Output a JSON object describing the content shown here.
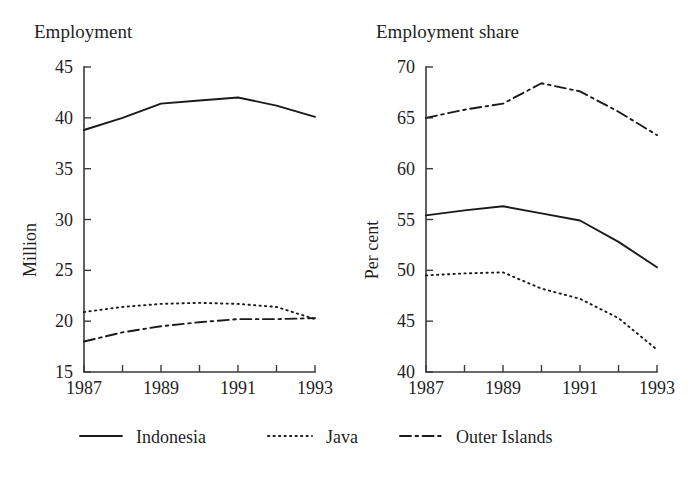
{
  "figure": {
    "background": "#ffffff",
    "ink_color": "#1a1a1a"
  },
  "legend": {
    "position": "bottom",
    "items": [
      {
        "label": "Indonesia",
        "style": "solid",
        "dash": "none"
      },
      {
        "label": "Java",
        "style": "dotted",
        "dash": "1,4"
      },
      {
        "label": "Outer Islands",
        "style": "dash-dot",
        "dash": "11,4,2.5,4"
      }
    ]
  },
  "chart_data": [
    {
      "type": "line",
      "title": "Employment",
      "xlabel": "",
      "ylabel": "Million",
      "x": [
        1987,
        1988,
        1989,
        1990,
        1991,
        1992,
        1993
      ],
      "xticks": [
        1987,
        1988,
        1989,
        1990,
        1991,
        1992,
        1993
      ],
      "xticklabels": [
        "1987",
        "",
        "1989",
        "",
        "1991",
        "",
        "1993"
      ],
      "yticks": [
        15,
        20,
        25,
        30,
        35,
        40,
        45
      ],
      "yticklabels": [
        "15",
        "20",
        "25",
        "30",
        "35",
        "40",
        "45"
      ],
      "xlim": [
        1987,
        1993
      ],
      "ylim": [
        15,
        45
      ],
      "grid": false,
      "series": [
        {
          "name": "Indonesia",
          "style": "solid",
          "values": [
            38.8,
            40.0,
            41.4,
            41.7,
            42.0,
            41.2,
            40.1
          ]
        },
        {
          "name": "Java",
          "style": "dotted",
          "values": [
            20.9,
            21.4,
            21.7,
            21.8,
            21.7,
            21.4,
            20.2
          ]
        },
        {
          "name": "Outer Islands",
          "style": "dash-dot",
          "values": [
            18.0,
            18.9,
            19.5,
            19.9,
            20.2,
            20.2,
            20.3
          ]
        }
      ]
    },
    {
      "type": "line",
      "title": "Employment share",
      "xlabel": "",
      "ylabel": "Per cent",
      "x": [
        1987,
        1988,
        1989,
        1990,
        1991,
        1992,
        1993
      ],
      "xticks": [
        1987,
        1988,
        1989,
        1990,
        1991,
        1992,
        1993
      ],
      "xticklabels": [
        "1987",
        "",
        "1989",
        "",
        "1991",
        "",
        "1993"
      ],
      "yticks": [
        40,
        45,
        50,
        55,
        60,
        65,
        70
      ],
      "yticklabels": [
        "40",
        "45",
        "50",
        "55",
        "60",
        "65",
        "70"
      ],
      "xlim": [
        1987,
        1993
      ],
      "ylim": [
        40,
        70
      ],
      "grid": false,
      "series": [
        {
          "name": "Indonesia",
          "style": "solid",
          "values": [
            55.4,
            55.9,
            56.3,
            55.6,
            54.9,
            52.8,
            50.3
          ]
        },
        {
          "name": "Java",
          "style": "dotted",
          "values": [
            49.5,
            49.7,
            49.8,
            48.2,
            47.2,
            45.3,
            42.2
          ]
        },
        {
          "name": "Outer Islands",
          "style": "dash-dot",
          "values": [
            65.0,
            65.8,
            66.4,
            68.4,
            67.6,
            65.6,
            63.3
          ]
        }
      ]
    }
  ]
}
